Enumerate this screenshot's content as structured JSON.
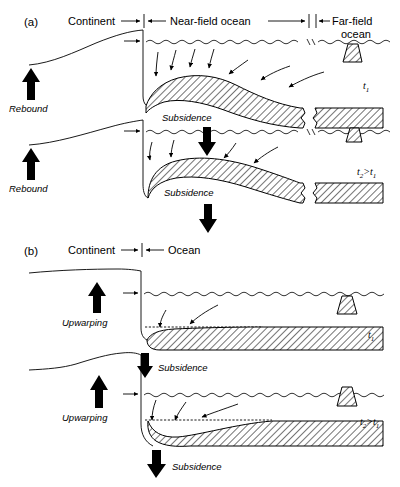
{
  "figure": {
    "panels": [
      {
        "id": "a",
        "label": "(a)",
        "zone_labels": [
          {
            "name": "continent",
            "text": "Continent"
          },
          {
            "name": "near-field-ocean",
            "text": "Near-field ocean"
          },
          {
            "name": "far-field-ocean-line1",
            "text": "Far-field"
          },
          {
            "name": "far-field-ocean-line2",
            "text": "ocean"
          }
        ],
        "timesteps": [
          {
            "id": "t1",
            "time_label": "t",
            "time_sub": "1",
            "time_sup": "",
            "rebound_label": "Rebound",
            "subsidence_label": "Subsidence"
          },
          {
            "id": "t2",
            "time_label": "t",
            "time_sub": "2",
            "time_rel": ">t",
            "time_sub2": "1",
            "rebound_label": "Rebound",
            "subsidence_label": "Subsidence"
          }
        ]
      },
      {
        "id": "b",
        "label": "(b)",
        "zone_labels": [
          {
            "name": "continent",
            "text": "Continent"
          },
          {
            "name": "ocean",
            "text": "Ocean"
          }
        ],
        "timesteps": [
          {
            "id": "t1",
            "time_label": "t",
            "time_sub": "1",
            "upwarping_label": "Upwarping",
            "subsidence_label": "Subsidence"
          },
          {
            "id": "t2",
            "time_label": "t",
            "time_sub": "2",
            "time_rel": ">t",
            "time_sub2": "1",
            "upwarping_label": "Upwarping",
            "subsidence_label": "Subsidence"
          }
        ]
      }
    ],
    "colors": {
      "ink": "#000000",
      "background": "#ffffff",
      "hatch": "#000000"
    }
  }
}
